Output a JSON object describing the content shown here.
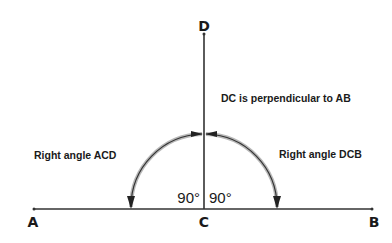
{
  "diagram": {
    "points": {
      "A": "A",
      "B": "B",
      "C": "C",
      "D": "D"
    },
    "statement": "DC is perpendicular to AB",
    "angle_labels": {
      "left": "Right angle ACD",
      "right": "Right angle DCB"
    },
    "angle_values": {
      "left": "90°",
      "right": "90°"
    },
    "colors": {
      "line": "#333333",
      "arc_halo": "#b0b0b0",
      "text": "#1a1a1a"
    }
  }
}
